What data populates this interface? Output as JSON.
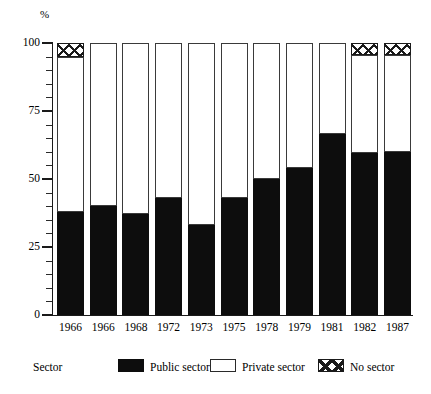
{
  "chart_data": {
    "type": "bar",
    "stacked": true,
    "title": "",
    "subtitle": "",
    "xlabel": "",
    "ylabel": "%",
    "ylim": [
      0,
      100
    ],
    "yticks": [
      0,
      25,
      50,
      75,
      100
    ],
    "ytick_labels": [
      "0",
      "25",
      "50",
      "75",
      "100"
    ],
    "minor_tick_step": 5,
    "grid": false,
    "legend_position": "bottom",
    "legend_title": "Sector",
    "categories": [
      "1966",
      "1966",
      "1968",
      "1972",
      "1973",
      "1975",
      "1978",
      "1979",
      "1981",
      "1982",
      "1987"
    ],
    "series": [
      {
        "name": "Public sector",
        "color": "#0d0d0d",
        "pattern": "solid-black",
        "values": [
          38,
          40,
          37,
          43,
          33,
          43,
          50,
          54,
          66.5,
          59.5,
          60
        ]
      },
      {
        "name": "Private sector",
        "color": "#ffffff",
        "pattern": "open-white",
        "values": [
          57,
          60,
          63,
          57,
          67,
          57,
          50,
          46,
          33.5,
          36,
          35.5
        ]
      },
      {
        "name": "No sector",
        "color": "#ffffff",
        "pattern": "crosshatch",
        "values": [
          5,
          0,
          0,
          0,
          0,
          0,
          0,
          0,
          0,
          4.5,
          4.5
        ]
      }
    ]
  },
  "axes": {
    "y_unit_label": "%",
    "y_tick_labels": [
      "100",
      "75",
      "50",
      "25",
      "0"
    ],
    "y_tick_values": [
      100,
      75,
      50,
      25,
      0
    ],
    "x_tick_labels": [
      "1966",
      "1966",
      "1968",
      "1972",
      "1973",
      "1975",
      "1978",
      "1979",
      "1981",
      "1982",
      "1987"
    ]
  },
  "legend": {
    "title": "Sector",
    "entries": [
      {
        "label": "Public sector",
        "swatch": "solid-black-swatch"
      },
      {
        "label": "Private sector",
        "swatch": "open-white-swatch"
      },
      {
        "label": "No sector",
        "swatch": "crosshatch-swatch"
      }
    ]
  },
  "colors": {
    "public_sector": "#0d0d0d",
    "private_sector": "#ffffff",
    "no_sector_lines": "#1a1a1a",
    "axis": "#1a1a1a",
    "background": "#ffffff"
  }
}
